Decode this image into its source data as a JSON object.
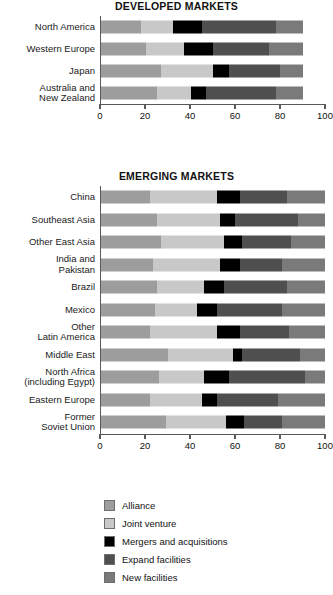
{
  "chart_data": {
    "type": "bar",
    "subtype": "horizontal-stacked",
    "title": "",
    "xlabel": "% of respondents",
    "ylabel": "",
    "grid": false,
    "legend_position": "bottom",
    "series": [
      {
        "name": "Alliance",
        "color": "#9d9d9d"
      },
      {
        "name": "Joint venture",
        "color": "#c8c8c8"
      },
      {
        "name": "Mergers and acquisitions",
        "color": "#000000"
      },
      {
        "name": "Expand facilities",
        "color": "#4f4f4f"
      },
      {
        "name": "New facilities",
        "color": "#7a7a7a"
      }
    ],
    "panels": [
      {
        "id": "developed",
        "title": "DEVELOPED MARKETS",
        "xlim": [
          0,
          100
        ],
        "xticks": [
          0,
          20,
          40,
          60,
          80,
          100
        ],
        "xticklabels": [
          "0",
          "20",
          "40",
          "60",
          "80",
          "100"
        ],
        "categories": [
          "North America",
          "Western Europe",
          "Japan",
          "Australia and New Zealand"
        ],
        "category_lines": [
          [
            "North America"
          ],
          [
            "Western Europe"
          ],
          [
            "Japan"
          ],
          [
            "Australia and",
            "New Zealand"
          ]
        ],
        "values": [
          [
            18,
            14,
            13,
            33,
            12
          ],
          [
            20,
            17,
            13,
            25,
            15
          ],
          [
            27,
            23,
            7,
            23,
            10
          ],
          [
            25,
            15,
            7,
            31,
            12
          ]
        ],
        "totals": [
          90,
          90,
          90,
          90
        ]
      },
      {
        "id": "emerging",
        "title": "EMERGING MARKETS",
        "xlim": [
          0,
          100
        ],
        "xticks": [
          0,
          20,
          40,
          60,
          80,
          100
        ],
        "xticklabels": [
          "0",
          "20",
          "40",
          "60",
          "80",
          "100"
        ],
        "categories": [
          "China",
          "Southeast Asia",
          "Other East Asia",
          "India and Pakistan",
          "Brazil",
          "Mexico",
          "Other Latin America",
          "Middle East",
          "North Africa (including Egypt)",
          "Eastern Europe",
          "Former Soviet Union"
        ],
        "category_lines": [
          [
            "China"
          ],
          [
            "Southeast Asia"
          ],
          [
            "Other East Asia"
          ],
          [
            "India and",
            "Pakistan"
          ],
          [
            "Brazil"
          ],
          [
            "Mexico"
          ],
          [
            "Other",
            "Latin America"
          ],
          [
            "Middle East"
          ],
          [
            "North Africa",
            "(including Egypt)"
          ],
          [
            "Eastern Europe"
          ],
          [
            "Former",
            "Soviet Union"
          ]
        ],
        "values": [
          [
            22,
            30,
            10,
            21,
            17
          ],
          [
            25,
            28,
            7,
            28,
            12
          ],
          [
            27,
            28,
            8,
            22,
            15
          ],
          [
            23,
            30,
            9,
            19,
            19
          ],
          [
            25,
            21,
            9,
            28,
            17
          ],
          [
            24,
            19,
            9,
            29,
            19
          ],
          [
            22,
            30,
            10,
            22,
            16
          ],
          [
            30,
            29,
            4,
            26,
            11
          ],
          [
            26,
            20,
            11,
            34,
            9
          ],
          [
            22,
            23,
            7,
            27,
            21
          ],
          [
            29,
            27,
            8,
            17,
            19
          ]
        ],
        "totals": [
          100,
          100,
          100,
          100,
          100,
          100,
          100,
          100,
          100,
          100,
          100
        ]
      }
    ]
  },
  "legend": {
    "items": [
      {
        "label": "Alliance",
        "color": "#9d9d9d"
      },
      {
        "label": "Joint venture",
        "color": "#c8c8c8"
      },
      {
        "label": "Mergers and acquisitions",
        "color": "#000000"
      },
      {
        "label": "Expand facilities",
        "color": "#4f4f4f"
      },
      {
        "label": "New facilities",
        "color": "#7a7a7a"
      }
    ]
  }
}
